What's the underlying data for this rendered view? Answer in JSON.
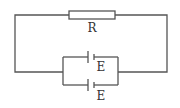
{
  "diagram": {
    "type": "circuit",
    "components": {
      "resistor": {
        "label": "R"
      },
      "battery_top": {
        "label": "E"
      },
      "battery_bottom": {
        "label": "E"
      }
    },
    "colors": {
      "wire": "#555555",
      "text": "#333333",
      "background": "#ffffff"
    }
  }
}
